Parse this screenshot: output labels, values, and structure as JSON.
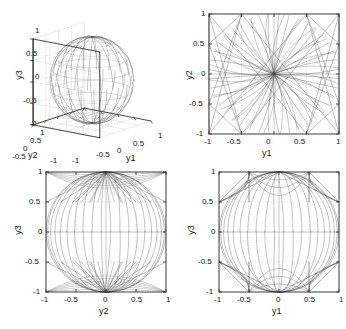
{
  "figure": {
    "type": "multi-panel-scientific-plot",
    "panel_count": 4,
    "line_color": "#4d4d4d",
    "grid_color": "#b4b4b4",
    "axis_color": "#303030"
  },
  "chart_data": [
    {
      "type": "line",
      "name": "panel-3d-y1-y2-y3",
      "title": "",
      "projection": "3d",
      "xlabel": "y1",
      "ylabel": "y2",
      "zlabel": "y3",
      "xlim": [
        -1,
        1
      ],
      "ylim": [
        -1,
        1
      ],
      "zlim": [
        -1,
        1
      ],
      "xticks": [
        -1,
        -0.5,
        0,
        0.5,
        1
      ],
      "yticks": [
        -1,
        -0.5,
        0,
        0.5,
        1
      ],
      "zticks": [
        -1,
        -0.5,
        0,
        0.5,
        1
      ],
      "xticklabels": [
        "-1",
        "-0.5",
        "0",
        "0.5",
        "1"
      ],
      "yticklabels": [
        "1",
        "0.5",
        "0",
        "-0.5",
        "-1"
      ],
      "zticklabels": [
        "1",
        "0.5",
        "0",
        "-0.5",
        "-1"
      ],
      "grid": true,
      "legend": "none",
      "description": "Bundle of trajectories on the unit sphere converging to the north pole (y3=1) and south pole (y3=-1)",
      "trajectory_count": 40,
      "attractors": [
        [
          0,
          0,
          1
        ],
        [
          0,
          0,
          -1
        ]
      ]
    },
    {
      "type": "line",
      "name": "panel-y1-y2",
      "title": "",
      "xlabel": "y1",
      "ylabel": "y2",
      "xlim": [
        -1,
        1
      ],
      "ylim": [
        -1,
        1
      ],
      "xticks": [
        -1,
        -0.5,
        0,
        0.5,
        1
      ],
      "yticks": [
        -1,
        -0.5,
        0,
        0.5,
        1
      ],
      "xticklabels": [
        "-1",
        "-0.5",
        "0",
        "0.5",
        "1"
      ],
      "yticklabels": [
        "-1",
        "-0.5",
        "0",
        "0.5",
        "1"
      ],
      "grid": true,
      "legend": "none",
      "description": "Projection onto y1-y2 plane; curved arcs from the boundary converge to a dense cusp at the origin, with straight chords linking corners",
      "trajectory_count": 40,
      "attractors": [
        [
          0,
          0
        ]
      ]
    },
    {
      "type": "line",
      "name": "panel-y2-y3",
      "title": "",
      "xlabel": "y2",
      "ylabel": "y3",
      "xlim": [
        -1,
        1
      ],
      "ylim": [
        -1,
        1
      ],
      "xticks": [
        -1,
        -0.5,
        0,
        0.5,
        1
      ],
      "yticks": [
        -1,
        -0.5,
        0,
        0.5,
        1
      ],
      "xticklabels": [
        "-1",
        "-0.5",
        "0",
        "0.5",
        "1"
      ],
      "yticklabels": [
        "-1",
        "-0.5",
        "0",
        "0.5",
        "1"
      ],
      "grid": true,
      "legend": "none",
      "description": "Projection onto y2-y3 plane; trajectories concentrate in bands near y3=1 and y3=-1 with an empty band between -0.5 and 0.5",
      "trajectory_count": 40,
      "attractors": [
        [
          0,
          1
        ],
        [
          0,
          -1
        ]
      ]
    },
    {
      "type": "line",
      "name": "panel-y1-y3",
      "title": "",
      "xlabel": "y1",
      "ylabel": "y3",
      "xlim": [
        -1,
        1
      ],
      "ylim": [
        -1,
        1
      ],
      "xticks": [
        -1,
        -0.5,
        0,
        0.5,
        1
      ],
      "yticks": [
        -1,
        -0.5,
        0,
        0.5,
        1
      ],
      "xticklabels": [
        "-1",
        "-0.5",
        "0",
        "0.5",
        "1"
      ],
      "yticklabels": [
        "-1",
        "-0.5",
        "0",
        "0.5",
        "1"
      ],
      "grid": true,
      "legend": "none",
      "description": "Projection onto y1-y3 plane; arcs plus sharp vertical drops at y1=-0.5 and y1=0.5 near y3=1 and y3=-1",
      "trajectory_count": 40,
      "attractors": [
        [
          0,
          1
        ],
        [
          0,
          -1
        ]
      ]
    }
  ],
  "panels": {
    "topleft": {
      "xlabel": "y1",
      "ylabel": "y2",
      "zlabel": "y3",
      "zticks": [
        "1",
        "0.5",
        "0",
        "-0.5",
        "-1"
      ],
      "yticks": [
        "1",
        "0.5",
        "0",
        "-0.5",
        "-1"
      ],
      "xticks": [
        "-1",
        "-0.5",
        "0",
        "0.5",
        "1"
      ]
    },
    "topright": {
      "xlabel": "y1",
      "ylabel": "y2",
      "xticks": [
        "-1",
        "-0.5",
        "0",
        "0.5",
        "1"
      ],
      "yticks": [
        "1",
        "0.5",
        "0",
        "-0.5",
        "-1"
      ]
    },
    "bottomleft": {
      "xlabel": "y2",
      "ylabel": "y3",
      "xticks": [
        "-1",
        "-0.5",
        "0",
        "0.5",
        "1"
      ],
      "yticks": [
        "1",
        "0.5",
        "0",
        "-0.5",
        "-1"
      ]
    },
    "bottomright": {
      "xlabel": "y1",
      "ylabel": "y3",
      "xticks": [
        "-1",
        "-0.5",
        "0",
        "0.5",
        "1"
      ],
      "yticks": [
        "1",
        "0.5",
        "0",
        "-0.5",
        "-1"
      ]
    }
  }
}
